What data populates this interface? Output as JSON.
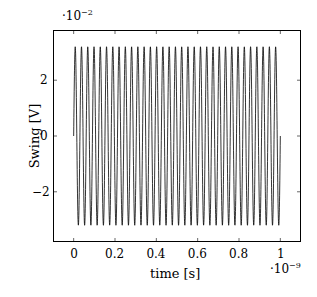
{
  "chart_data": {
    "type": "line",
    "title": "",
    "xlabel": "time [s]",
    "ylabel": "Swing [V]",
    "x_multiplier": "·10^-9",
    "y_multiplier": "·10^-2",
    "x_ticks": [
      "0",
      "0.2",
      "0.4",
      "0.6",
      "0.8",
      "1"
    ],
    "y_ticks": [
      "2",
      "0",
      "−2"
    ],
    "xlim": [
      -0.1,
      1.1
    ],
    "ylim": [
      -3.8,
      3.8
    ],
    "grid": false,
    "legend": null,
    "series": [
      {
        "name": "swing",
        "description": "sinusoidal oscillation",
        "amplitude": 3.2,
        "frequency_cycles_in_range": 33,
        "x_start": 0,
        "x_end": 1,
        "y_start": 0,
        "y_end": 0.5,
        "color": "#000000"
      }
    ]
  },
  "labels": {
    "xlabel": "time [s]",
    "ylabel": "Swing [V]",
    "x_exp_base": "·10",
    "x_exp_power": "−9",
    "y_exp_base": "·10",
    "y_exp_power": "−2"
  }
}
